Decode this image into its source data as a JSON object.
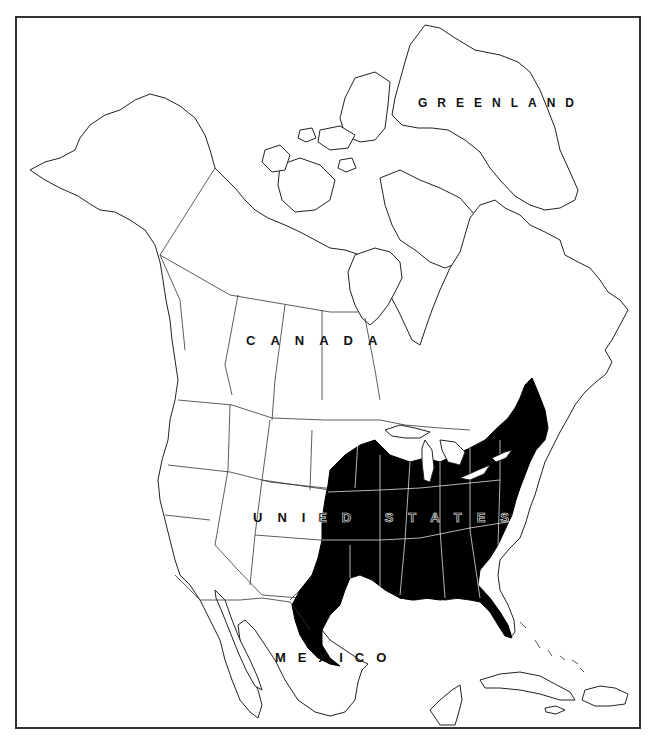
{
  "map": {
    "type": "range-map",
    "region": "North America",
    "frame_color": "#333333",
    "land_fill": "#ffffff",
    "outline_color": "#222222",
    "range_fill": "#000000",
    "labels": {
      "greenland": "GREENLAND",
      "canada": "CANADA",
      "united_states_west": "UNIT",
      "united_states_east": "ED STATES",
      "mexico": "MEXICO"
    },
    "shaded_range": {
      "description": "Eastern and central United States",
      "extent": "Texas and Oklahoma east to the Atlantic coast, north to the Great Lakes and New England, south through Florida"
    }
  }
}
